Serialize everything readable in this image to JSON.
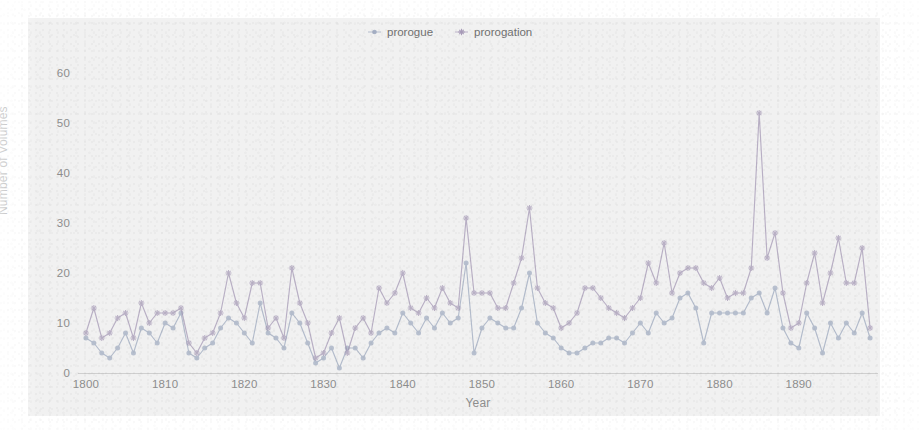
{
  "chart_data": {
    "type": "line",
    "title": "",
    "xlabel": "Year",
    "ylabel": "Number of Volumes",
    "xlim": [
      1799,
      1900
    ],
    "ylim": [
      0,
      63
    ],
    "grid": false,
    "legend_position": "top-center",
    "xticks": [
      1800,
      1810,
      1820,
      1830,
      1840,
      1850,
      1860,
      1870,
      1880,
      1890
    ],
    "yticks": [
      0,
      10,
      20,
      30,
      40,
      50,
      60
    ],
    "x": [
      1800,
      1801,
      1802,
      1803,
      1804,
      1805,
      1806,
      1807,
      1808,
      1809,
      1810,
      1811,
      1812,
      1813,
      1814,
      1815,
      1816,
      1817,
      1818,
      1819,
      1820,
      1821,
      1822,
      1823,
      1824,
      1825,
      1826,
      1827,
      1828,
      1829,
      1830,
      1831,
      1832,
      1833,
      1834,
      1835,
      1836,
      1837,
      1838,
      1839,
      1840,
      1841,
      1842,
      1843,
      1844,
      1845,
      1846,
      1847,
      1848,
      1849,
      1850,
      1851,
      1852,
      1853,
      1854,
      1855,
      1856,
      1857,
      1858,
      1859,
      1860,
      1861,
      1862,
      1863,
      1864,
      1865,
      1866,
      1867,
      1868,
      1869,
      1870,
      1871,
      1872,
      1873,
      1874,
      1875,
      1876,
      1877,
      1878,
      1879,
      1880,
      1881,
      1882,
      1883,
      1884,
      1885,
      1886,
      1887,
      1888,
      1889,
      1890,
      1891,
      1892,
      1893,
      1894,
      1895,
      1896,
      1897,
      1898,
      1899
    ],
    "series": [
      {
        "name": "prorogue",
        "color": "#8d9bb5",
        "marker": "circle",
        "values": [
          7,
          6,
          4,
          3,
          5,
          8,
          4,
          9,
          8,
          6,
          10,
          9,
          12,
          4,
          3,
          5,
          6,
          9,
          11,
          10,
          8,
          6,
          14,
          8,
          7,
          5,
          12,
          10,
          6,
          2,
          3,
          5,
          1,
          5,
          5,
          3,
          6,
          8,
          9,
          8,
          12,
          10,
          8,
          11,
          9,
          12,
          10,
          11,
          22,
          4,
          9,
          11,
          10,
          9,
          9,
          13,
          20,
          10,
          8,
          7,
          5,
          4,
          4,
          5,
          6,
          6,
          7,
          7,
          6,
          8,
          10,
          8,
          12,
          10,
          11,
          15,
          16,
          13,
          6,
          12,
          12,
          12,
          12,
          12,
          15,
          16,
          12,
          17,
          9,
          6,
          5,
          12,
          9,
          4,
          10,
          7,
          10,
          8,
          12,
          7
        ]
      },
      {
        "name": "prorogation",
        "color": "#9e90b0",
        "marker": "star",
        "values": [
          8,
          13,
          7,
          8,
          11,
          12,
          7,
          14,
          10,
          12,
          12,
          12,
          13,
          6,
          4,
          7,
          8,
          12,
          20,
          14,
          11,
          18,
          18,
          9,
          11,
          7,
          21,
          14,
          10,
          3,
          4,
          8,
          11,
          4,
          9,
          11,
          8,
          17,
          14,
          16,
          20,
          13,
          12,
          15,
          13,
          17,
          14,
          13,
          31,
          16,
          16,
          16,
          13,
          13,
          18,
          23,
          33,
          17,
          14,
          13,
          9,
          10,
          12,
          17,
          17,
          15,
          13,
          12,
          11,
          13,
          15,
          22,
          18,
          26,
          16,
          20,
          21,
          21,
          18,
          17,
          19,
          15,
          16,
          16,
          21,
          52,
          23,
          28,
          16,
          9,
          10,
          18,
          24,
          14,
          20,
          27,
          18,
          18,
          25,
          9
        ]
      }
    ]
  },
  "legend": {
    "entries": [
      {
        "label": "prorogue"
      },
      {
        "label": "prorogation"
      }
    ]
  },
  "axes": {
    "ylabel": "Number of Volumes",
    "xlabel": "Year",
    "yticks": [
      "60",
      "50",
      "40",
      "30",
      "20",
      "10",
      "0"
    ],
    "xticks": [
      "1800",
      "1810",
      "1820",
      "1830",
      "1840",
      "1850",
      "1860",
      "1870",
      "1880",
      "1890"
    ]
  }
}
